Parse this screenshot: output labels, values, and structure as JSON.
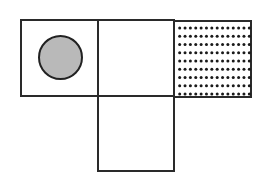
{
  "diagram": {
    "type": "cube-net-fragment",
    "squares": [
      {
        "id": "left",
        "position": "top-left",
        "pattern": "gray-filled-circle"
      },
      {
        "id": "middle",
        "position": "top-middle",
        "pattern": "blank"
      },
      {
        "id": "right",
        "position": "top-right",
        "pattern": "dot-grid"
      },
      {
        "id": "bottom",
        "position": "below-middle",
        "pattern": "blank"
      }
    ],
    "dot_grid": {
      "columns": 14,
      "rows": 9
    },
    "colors": {
      "stroke": "#2a2a2a",
      "circle_fill": "#b9b9b9",
      "dot": "#1a1a1a",
      "background": "#ffffff"
    }
  }
}
